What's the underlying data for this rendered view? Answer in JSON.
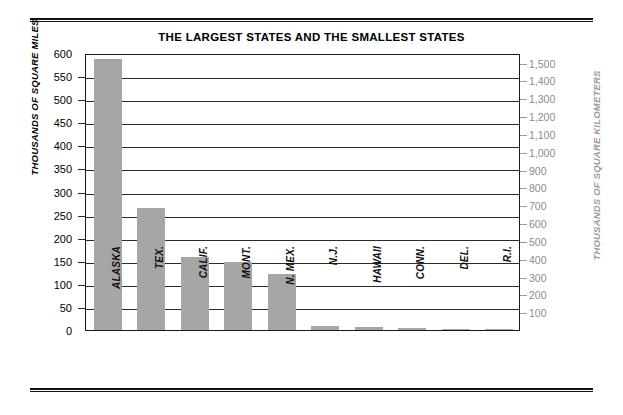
{
  "chart_data": {
    "type": "bar",
    "title": "THE LARGEST STATES AND THE SMALLEST STATES",
    "categories": [
      "ALASKA",
      "TEX.",
      "CALIF.",
      "MONT.",
      "N. MEX.",
      "N.J.",
      "HAWAII",
      "CONN.",
      "DEL.",
      "R.I."
    ],
    "values": [
      586,
      264,
      158,
      147,
      122,
      8,
      6.5,
      5,
      2,
      1.2
    ],
    "xlabel": "",
    "ylabel": "THOUSANDS OF SQUARE MILES",
    "ylabel_secondary": "THOUSANDS OF SQUARE KILOMETERS",
    "ylim": [
      0,
      600
    ],
    "ylim_secondary": [
      0,
      1554
    ],
    "yticks": [
      600,
      550,
      500,
      450,
      400,
      350,
      300,
      250,
      200,
      150,
      100,
      50,
      0
    ],
    "yticks_secondary": [
      1500,
      1400,
      1300,
      1200,
      1100,
      1000,
      900,
      800,
      700,
      600,
      500,
      400,
      300,
      200,
      100
    ],
    "ytick_labels": [
      "600",
      "550",
      "500",
      "450",
      "400",
      "350",
      "300",
      "250",
      "200",
      "150",
      "100",
      "50",
      "0"
    ],
    "ytick_labels_secondary": [
      "1,500",
      "1,400",
      "1,300",
      "1,200",
      "1,100",
      "1,000",
      "900",
      "800",
      "700",
      "600",
      "500",
      "400",
      "300",
      "200",
      "100"
    ],
    "grid": true,
    "legend": "none",
    "bar_color": "#a6a6a6",
    "axis_color": "#1a1a1a",
    "secondary_axis_color": "#9a9a9a"
  }
}
